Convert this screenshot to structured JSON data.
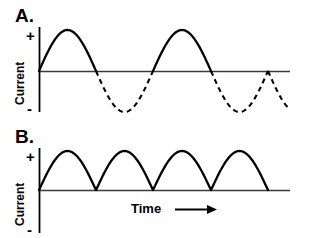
{
  "figure": {
    "width": 309,
    "height": 238,
    "background": "#ffffff",
    "ink_color": "#000000",
    "axis_color": "#3a3a3a"
  },
  "panels": [
    {
      "id": "A",
      "label": "A.",
      "y_axis_title": "Current",
      "y_positive_sign": "+",
      "y_negative_sign": "-",
      "x_axis_label": ""
    },
    {
      "id": "B",
      "label": "B.",
      "y_axis_title": "Current",
      "y_positive_sign": "+",
      "y_negative_sign": "-",
      "x_axis_label": "Time"
    }
  ],
  "chart_data": [
    {
      "type": "line",
      "title": "A.",
      "subtitle": "Alternating current sine wave: positive half-cycles drawn solid, negative half-cycles drawn dashed",
      "xlabel": "",
      "ylabel": "Current",
      "ytick_labels": [
        "+",
        "-"
      ],
      "xtick_labels": [],
      "grid": false,
      "legend": "none",
      "xlim": [
        0,
        4.4
      ],
      "ylim": [
        -1.15,
        1.15
      ],
      "axis_origin_x_px": 39,
      "zero_line_y_px": 71,
      "period_px": 114,
      "amplitude_px": 41,
      "series": [
        {
          "name": "positive half-cycles (solid)",
          "style": "solid",
          "zero_crossings_px": [
            39,
            96,
            153,
            211,
            268
          ],
          "peaks_px": [
            {
              "x": 68,
              "y": 29
            },
            {
              "x": 182,
              "y": 29
            }
          ],
          "half_cycles": [
            [
              39,
              96
            ],
            [
              153,
              211
            ]
          ]
        },
        {
          "name": "negative half-cycles (dashed)",
          "style": "dashed",
          "troughs_px": [
            {
              "x": 125,
              "y": 112
            },
            {
              "x": 239,
              "y": 112
            }
          ],
          "half_cycles": [
            [
              96,
              153
            ],
            [
              211,
              268
            ]
          ],
          "partial_half_cycle": [
            268,
            290
          ]
        }
      ],
      "waveform": "sine",
      "cycles_shown": 2.2
    },
    {
      "type": "line",
      "title": "B.",
      "subtitle": "Full-wave rectified current: every half-cycle is positive, drawn solid",
      "xlabel": "Time",
      "ylabel": "Current",
      "ytick_labels": [
        "+",
        "-"
      ],
      "xtick_labels": [],
      "grid": false,
      "legend": "none",
      "xlim": [
        0,
        4.4
      ],
      "ylim": [
        -1.15,
        1.15
      ],
      "axis_origin_x_px": 39,
      "zero_line_y_px": 71,
      "period_px": 57,
      "amplitude_px": 39,
      "series": [
        {
          "name": "rectified half-cycles (solid)",
          "style": "solid",
          "zero_crossings_px": [
            39,
            96,
            153,
            211,
            268
          ],
          "peaks_px": [
            {
              "x": 68,
              "y": 32
            },
            {
              "x": 125,
              "y": 32
            },
            {
              "x": 182,
              "y": 32
            },
            {
              "x": 239,
              "y": 32
            }
          ],
          "half_cycles": [
            [
              39,
              96
            ],
            [
              96,
              153
            ],
            [
              153,
              211
            ],
            [
              211,
              268
            ]
          ]
        }
      ],
      "waveform": "rectified-sine",
      "humps_shown": 4,
      "arrow": {
        "name": "time-direction-arrow",
        "from_px": 175,
        "to_px": 216,
        "y_px": 209,
        "direction": "right"
      }
    }
  ]
}
